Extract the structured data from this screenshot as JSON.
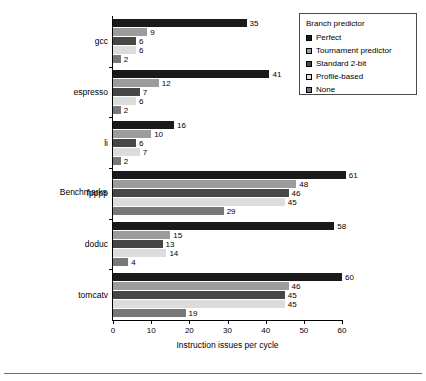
{
  "chart_data": {
    "type": "bar",
    "orientation": "horizontal",
    "title": "",
    "xlabel": "Instruction issues per cycle",
    "ylabel": "Benchmarks",
    "xlim": [
      0,
      60
    ],
    "xticks": [
      0,
      10,
      20,
      30,
      40,
      50,
      60
    ],
    "grid": false,
    "legend_position": "top-right",
    "legend_title": "Branch predictor",
    "categories": [
      "gcc",
      "espresso",
      "li",
      "fpppp",
      "doduc",
      "tomcatv"
    ],
    "series": [
      {
        "name": "Perfect",
        "color": "#1a1a1a",
        "values": [
          35,
          41,
          16,
          61,
          58,
          60
        ]
      },
      {
        "name": "Tournament predictor",
        "color": "#9c9c9c",
        "values": [
          9,
          12,
          10,
          48,
          15,
          46
        ]
      },
      {
        "name": "Standard 2-bit",
        "color": "#474747",
        "values": [
          6,
          7,
          6,
          46,
          13,
          45
        ]
      },
      {
        "name": "Profile-based",
        "color": "#dcdcdc",
        "values": [
          6,
          6,
          7,
          45,
          14,
          45
        ]
      },
      {
        "name": "None",
        "color": "#787878",
        "values": [
          2,
          2,
          2,
          29,
          4,
          19
        ]
      }
    ]
  },
  "legend": {
    "title": "Branch predictor",
    "items": [
      {
        "label": "Perfect",
        "color": "#1a1a1a"
      },
      {
        "label": "Tournament predictor",
        "color": "#9c9c9c"
      },
      {
        "label": "Standard 2-bit",
        "color": "#474747"
      },
      {
        "label": "Profile-based",
        "color": "#dcdcdc"
      },
      {
        "label": "None",
        "color": "#787878"
      }
    ]
  },
  "axes": {
    "x_label": "Instruction issues per cycle",
    "y_label": "Benchmarks",
    "x_tick_labels": [
      "0",
      "10",
      "20",
      "30",
      "40",
      "50",
      "60"
    ]
  }
}
